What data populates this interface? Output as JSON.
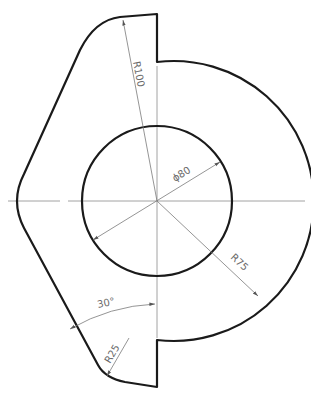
{
  "drawing": {
    "type": "mechanical part drawing",
    "dimensions": {
      "r100": "R100",
      "phi80": "ϕ80",
      "r75": "R75",
      "angle30": "30°",
      "r25": "R25"
    },
    "colors": {
      "outline": "#1a1a1a",
      "centerline": "#8a8a8a",
      "dimension": "#7a7a7a",
      "background": "#ffffff"
    }
  }
}
